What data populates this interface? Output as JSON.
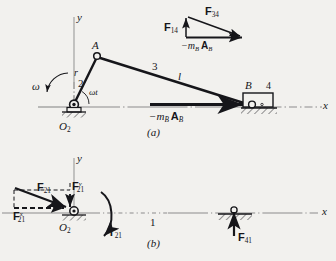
{
  "figure": {
    "caption_a": "(a)",
    "caption_b": "(b)"
  },
  "diagram_a": {
    "axis_y": "y",
    "axis_x": "x",
    "joint_a": "A",
    "joint_b": "B",
    "ground_pivot": "O",
    "ground_pivot_sub": "2",
    "crank_length": "r",
    "crank_number": "2",
    "coupler_number": "3",
    "coupler_length": "l",
    "slider_number": "4",
    "omega": "ω",
    "angle": "ωt",
    "inertia_force_prefix": "−m",
    "inertia_force_sub1": "B",
    "inertia_force_vec": "A",
    "inertia_force_sub2": "B"
  },
  "force_triangle": {
    "f14_label": "F",
    "f14_sub": "14",
    "f34_label": "F",
    "f34_sub": "34",
    "base_prefix": "−m",
    "base_sub1": "B",
    "base_vec": "A",
    "base_sub2": "B"
  },
  "diagram_b": {
    "axis_y": "y",
    "axis_x": "x",
    "ground_pivot": "O",
    "ground_pivot_sub": "2",
    "ground_link_number": "1",
    "f21_label": "F",
    "f21_sub": "21",
    "f21y_label": "F",
    "f21y_sub": "21",
    "f21y_sup": "y",
    "f21x_label": "F",
    "f21x_sub": "21",
    "f21x_sup": "x",
    "torque_label": "T",
    "torque_sub": "21",
    "f41_label": "F",
    "f41_sub": "41"
  },
  "colors": {
    "ink": "#16161a",
    "axis": "#8b8b8b",
    "background": "#f2f1ee"
  }
}
